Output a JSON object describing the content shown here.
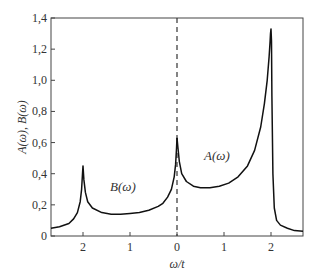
{
  "chart_data": {
    "type": "line",
    "title": "",
    "xlabel": "ω/t",
    "ylabel": "A(ω), B(ω)",
    "x_ticks": [
      {
        "pos": -2,
        "label": "2"
      },
      {
        "pos": -1,
        "label": "1"
      },
      {
        "pos": 0,
        "label": "0"
      },
      {
        "pos": 1,
        "label": "1"
      },
      {
        "pos": 2,
        "label": "2"
      }
    ],
    "y_ticks": [
      {
        "pos": 0,
        "label": "0"
      },
      {
        "pos": 0.2,
        "label": "0,2"
      },
      {
        "pos": 0.4,
        "label": "0,4"
      },
      {
        "pos": 0.6,
        "label": "0,6"
      },
      {
        "pos": 0.8,
        "label": "0,8"
      },
      {
        "pos": 1.0,
        "label": "1,0"
      },
      {
        "pos": 1.2,
        "label": "1,2"
      },
      {
        "pos": 1.4,
        "label": "1,4"
      }
    ],
    "xlim": [
      -2.68,
      2.68
    ],
    "ylim": [
      0,
      1.4
    ],
    "grid": false,
    "divider": {
      "x": 0,
      "style": "dashed"
    },
    "series": [
      {
        "name": "B(ω)",
        "label_pos": {
          "x": -1.15,
          "y": 0.29
        },
        "x": [
          -2.68,
          -2.5,
          -2.3,
          -2.2,
          -2.12,
          -2.06,
          -2.03,
          -2.01,
          -2.0,
          -1.98,
          -1.95,
          -1.9,
          -1.8,
          -1.6,
          -1.4,
          -1.2,
          -1.0,
          -0.8,
          -0.6,
          -0.4,
          -0.3,
          -0.2,
          -0.12,
          -0.06,
          -0.03,
          -0.01,
          0.0
        ],
        "values": [
          0.05,
          0.06,
          0.08,
          0.11,
          0.15,
          0.22,
          0.3,
          0.4,
          0.45,
          0.36,
          0.28,
          0.22,
          0.18,
          0.15,
          0.14,
          0.14,
          0.145,
          0.15,
          0.165,
          0.19,
          0.21,
          0.25,
          0.3,
          0.38,
          0.46,
          0.56,
          0.63
        ]
      },
      {
        "name": "A(ω)",
        "label_pos": {
          "x": 0.85,
          "y": 0.49
        },
        "x": [
          0.0,
          0.02,
          0.05,
          0.1,
          0.2,
          0.35,
          0.5,
          0.7,
          0.9,
          1.1,
          1.3,
          1.5,
          1.65,
          1.78,
          1.86,
          1.92,
          1.96,
          1.98,
          1.99,
          2.0,
          2.01,
          2.02,
          2.04,
          2.07,
          2.12,
          2.2,
          2.35,
          2.5,
          2.68
        ],
        "values": [
          0.63,
          0.57,
          0.48,
          0.4,
          0.35,
          0.32,
          0.31,
          0.31,
          0.32,
          0.34,
          0.38,
          0.45,
          0.55,
          0.7,
          0.85,
          1.0,
          1.15,
          1.25,
          1.3,
          1.33,
          1.25,
          0.9,
          0.4,
          0.18,
          0.1,
          0.07,
          0.05,
          0.035,
          0.03
        ]
      }
    ]
  }
}
